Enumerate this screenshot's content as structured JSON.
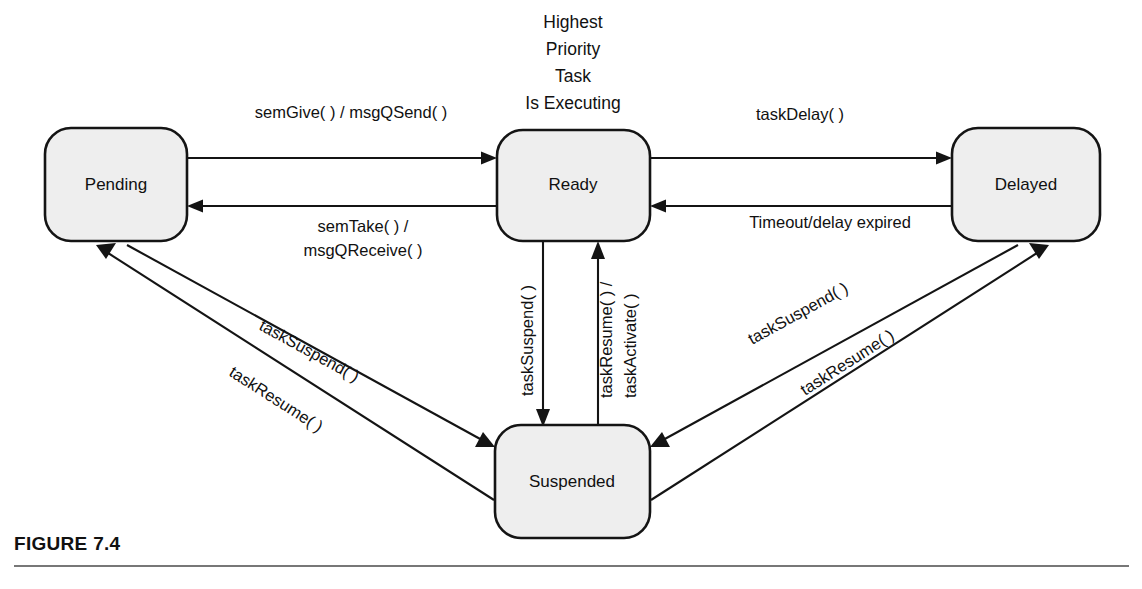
{
  "figure": {
    "caption": "FIGURE 7.4",
    "center_title_lines": [
      "Highest",
      "Priority",
      "Task",
      "Is Executing"
    ]
  },
  "colors": {
    "state_fill": "#eeeeee",
    "state_stroke": "#141414",
    "text": "#111111",
    "rule": "#777777",
    "background": "#ffffff"
  },
  "states": [
    {
      "id": "pending",
      "label": "Pending",
      "x": 45,
      "y": 128,
      "w": 142,
      "h": 113
    },
    {
      "id": "ready",
      "label": "Ready",
      "x": 497,
      "y": 130,
      "w": 153,
      "h": 111
    },
    {
      "id": "delayed",
      "label": "Delayed",
      "x": 952,
      "y": 128,
      "w": 148,
      "h": 113
    },
    {
      "id": "suspended",
      "label": "Suspended",
      "x": 495,
      "y": 425,
      "w": 155,
      "h": 113
    }
  ],
  "transitions": [
    {
      "id": "pending-to-ready",
      "from": "pending",
      "to": "ready",
      "label": "semGive( ) / msgQSend( )"
    },
    {
      "id": "ready-to-pending",
      "from": "ready",
      "to": "pending",
      "label": "semTake( ) /\nmsgQReceive( )"
    },
    {
      "id": "ready-to-delayed",
      "from": "ready",
      "to": "delayed",
      "label": "taskDelay( )"
    },
    {
      "id": "delayed-to-ready",
      "from": "delayed",
      "to": "ready",
      "label": "Timeout/delay expired"
    },
    {
      "id": "ready-to-suspended",
      "from": "ready",
      "to": "suspended",
      "label": "taskSuspend( )"
    },
    {
      "id": "suspended-to-ready",
      "from": "suspended",
      "to": "ready",
      "label": "taskResume( ) /\ntaskActivate( )"
    },
    {
      "id": "pending-to-suspended",
      "from": "pending",
      "to": "suspended",
      "label": "taskSuspend( )"
    },
    {
      "id": "suspended-to-pending",
      "from": "suspended",
      "to": "pending",
      "label": "taskResume( )"
    },
    {
      "id": "delayed-to-suspended",
      "from": "delayed",
      "to": "suspended",
      "label": "taskSuspend( )"
    },
    {
      "id": "suspended-to-delayed",
      "from": "suspended",
      "to": "delayed",
      "label": "taskResume( )"
    }
  ],
  "labels": {
    "sem_give_msgq_send": "semGive( ) / msgQSend( )",
    "sem_take": "semTake( ) /",
    "msgq_receive": "msgQReceive( )",
    "task_delay": "taskDelay( )",
    "timeout_expired": "Timeout/delay expired",
    "task_suspend_center": "taskSuspend( )",
    "task_resume_center": "taskResume( ) /",
    "task_activate_center": "taskActivate( )",
    "task_suspend_left": "taskSuspend( )",
    "task_resume_left": "taskResume( )",
    "task_suspend_right": "taskSuspend( )",
    "task_resume_right": "taskResume( )"
  },
  "center_title": {
    "line1": "Highest",
    "line2": "Priority",
    "line3": "Task",
    "line4": "Is Executing"
  },
  "state_labels": {
    "pending": "Pending",
    "ready": "Ready",
    "delayed": "Delayed",
    "suspended": "Suspended"
  }
}
